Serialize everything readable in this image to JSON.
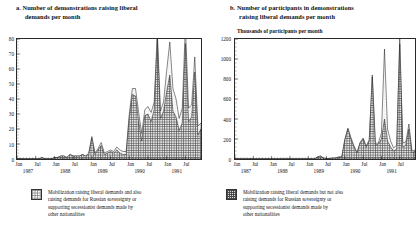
{
  "panels": [
    {
      "id": "a",
      "title_line1": "a.  Number of demonstrations raising liberal",
      "title_line2": "demands per month",
      "subtitle": "",
      "legend": {
        "l1": "Mobilization raising liberal demands and also",
        "l2": "raising demands for Russian sovereignty or",
        "l3": "supporting secessionist demands made by",
        "l4": "other nationalities"
      }
    },
    {
      "id": "b",
      "title_line1": "b.  Number of participants in  demonstrations",
      "title_line2": "raising liberal demands per month",
      "subtitle": "Thousands of participants per month",
      "legend": {
        "l1": "Mobilization raising liberal demands but not also",
        "l2": "raising demands for Russian sovereignty or",
        "l3": "supporting secessionist demands made by",
        "l4": "other nationalities"
      }
    }
  ],
  "chart_data": [
    {
      "type": "area",
      "title": "a. Number of demonstrations raising liberal demands per month",
      "xlabel": "",
      "ylabel": "",
      "ylim": [
        0,
        80
      ],
      "yticks": [
        0,
        10,
        20,
        30,
        40,
        50,
        60,
        70,
        80
      ],
      "ytick_labels": [
        "0",
        "10",
        "20",
        "30",
        "40",
        "50",
        "60",
        "70",
        "80"
      ],
      "xtick_labels": [
        "Jan",
        "Jul",
        "Jan",
        "Jul",
        "Jan",
        "Jul",
        "Jan",
        "Jul",
        "Jan",
        "Jul"
      ],
      "year_labels": [
        "1987",
        "1988",
        "1989",
        "1990",
        "1991"
      ],
      "grid": false,
      "legend_position": "below",
      "stacked": true,
      "x": [
        "1987-01",
        "1987-02",
        "1987-03",
        "1987-04",
        "1987-05",
        "1987-06",
        "1987-07",
        "1987-08",
        "1987-09",
        "1987-10",
        "1987-11",
        "1987-12",
        "1988-01",
        "1988-02",
        "1988-03",
        "1988-04",
        "1988-05",
        "1988-06",
        "1988-07",
        "1988-08",
        "1988-09",
        "1988-10",
        "1988-11",
        "1988-12",
        "1989-01",
        "1989-02",
        "1989-03",
        "1989-04",
        "1989-05",
        "1989-06",
        "1989-07",
        "1989-08",
        "1989-09",
        "1989-10",
        "1989-11",
        "1989-12",
        "1990-01",
        "1990-02",
        "1990-03",
        "1990-04",
        "1990-05",
        "1990-06",
        "1990-07",
        "1990-08",
        "1990-09",
        "1990-10",
        "1990-11",
        "1990-12",
        "1991-01",
        "1991-02",
        "1991-03",
        "1991-04",
        "1991-05",
        "1991-06",
        "1991-07",
        "1991-08",
        "1991-09",
        "1991-10",
        "1991-11",
        "1991-12"
      ],
      "series": [
        {
          "name": "Mobilization raising liberal demands and also raising demands for Russian sovereignty or supporting secessionist demands made by other nationalities",
          "pattern": "dotted",
          "values": [
            0,
            0,
            0,
            0,
            0,
            0,
            0,
            0,
            0,
            0,
            0,
            0,
            0,
            0,
            0,
            0,
            0,
            0,
            0,
            0,
            0,
            0,
            0,
            1,
            1,
            1,
            1,
            2,
            1,
            1,
            1,
            1,
            2,
            2,
            2,
            2,
            3,
            4,
            5,
            6,
            5,
            4,
            5,
            6,
            5,
            4,
            5,
            6,
            14,
            22,
            15,
            12,
            8,
            10,
            12,
            9,
            8,
            10,
            6,
            4
          ]
        },
        {
          "name": "Mobilization raising liberal demands but not also raising demands for Russian sovereignty or supporting secessionist demands made by other nationalities",
          "pattern": "hatched",
          "values": [
            0,
            0,
            0,
            0,
            0,
            0,
            0,
            0,
            1,
            0,
            0,
            0,
            1,
            1,
            2,
            2,
            1,
            3,
            2,
            2,
            2,
            3,
            2,
            3,
            14,
            3,
            6,
            9,
            3,
            4,
            5,
            4,
            6,
            4,
            3,
            3,
            27,
            43,
            42,
            25,
            12,
            29,
            30,
            25,
            33,
            80,
            27,
            32,
            45,
            56,
            32,
            28,
            19,
            24,
            77,
            25,
            28,
            58,
            16,
            20
          ]
        }
      ],
      "peaks": [
        {
          "label": "Oct 1990",
          "value": 80
        },
        {
          "label": "Jul 1991",
          "value": 77
        },
        {
          "label": "Feb 1991",
          "value": 56
        },
        {
          "label": "Oct 1991",
          "value": 58
        }
      ]
    },
    {
      "type": "area",
      "title": "b. Number of participants in demonstrations raising liberal demands per month",
      "xlabel": "",
      "ylabel": "Thousands of participants per month",
      "ylim": [
        0,
        1200
      ],
      "yticks": [
        0,
        200,
        400,
        600,
        800,
        1000,
        1200
      ],
      "ytick_labels": [
        "0",
        "200",
        "400",
        "600",
        "800",
        "1000",
        "1200"
      ],
      "xtick_labels": [
        "Jan",
        "Jul",
        "Jan",
        "Jul",
        "Jan",
        "Jul",
        "Jan",
        "Jul",
        "Jan",
        "Jul"
      ],
      "year_labels": [
        "1987",
        "1988",
        "1989",
        "1990",
        "1991"
      ],
      "grid": false,
      "legend_position": "below",
      "stacked": true,
      "x": [
        "1987-01",
        "1987-02",
        "1987-03",
        "1987-04",
        "1987-05",
        "1987-06",
        "1987-07",
        "1987-08",
        "1987-09",
        "1987-10",
        "1987-11",
        "1987-12",
        "1988-01",
        "1988-02",
        "1988-03",
        "1988-04",
        "1988-05",
        "1988-06",
        "1988-07",
        "1988-08",
        "1988-09",
        "1988-10",
        "1988-11",
        "1988-12",
        "1989-01",
        "1989-02",
        "1989-03",
        "1989-04",
        "1989-05",
        "1989-06",
        "1989-07",
        "1989-08",
        "1989-09",
        "1989-10",
        "1989-11",
        "1989-12",
        "1990-01",
        "1990-02",
        "1990-03",
        "1990-04",
        "1990-05",
        "1990-06",
        "1990-07",
        "1990-08",
        "1990-09",
        "1990-10",
        "1990-11",
        "1990-12",
        "1991-01",
        "1991-02",
        "1991-03",
        "1991-04",
        "1991-05",
        "1991-06",
        "1991-07",
        "1991-08",
        "1991-09",
        "1991-10",
        "1991-11",
        "1991-12"
      ],
      "series": [
        {
          "name": "Mobilization raising liberal demands and also raising demands for Russian sovereignty or supporting secessionist demands made by other nationalities",
          "pattern": "dotted",
          "values": [
            0,
            0,
            0,
            0,
            0,
            0,
            0,
            0,
            0,
            0,
            0,
            0,
            0,
            0,
            0,
            0,
            0,
            0,
            0,
            0,
            0,
            0,
            0,
            0,
            0,
            0,
            0,
            0,
            0,
            0,
            0,
            0,
            0,
            0,
            0,
            0,
            5,
            10,
            15,
            10,
            5,
            5,
            10,
            10,
            10,
            20,
            15,
            10,
            60,
            700,
            120,
            60,
            30,
            40,
            60,
            40,
            30,
            50,
            20,
            10
          ]
        },
        {
          "name": "Mobilization raising liberal demands but not also raising demands for Russian sovereignty or supporting secessionist demands made by other nationalities",
          "pattern": "hatched",
          "values": [
            0,
            0,
            0,
            0,
            0,
            0,
            0,
            0,
            0,
            0,
            0,
            0,
            0,
            0,
            0,
            0,
            0,
            0,
            0,
            0,
            0,
            0,
            0,
            0,
            0,
            0,
            0,
            20,
            30,
            10,
            5,
            5,
            10,
            10,
            20,
            20,
            190,
            300,
            200,
            120,
            60,
            160,
            200,
            120,
            180,
            820,
            140,
            150,
            200,
            400,
            180,
            120,
            80,
            100,
            1150,
            120,
            140,
            300,
            60,
            80
          ]
        }
      ],
      "peaks": [
        {
          "label": "Oct 1990",
          "value": 840
        },
        {
          "label": "Feb 1991",
          "value": 1100
        },
        {
          "label": "Jul 1991",
          "value": 1200
        }
      ]
    }
  ]
}
